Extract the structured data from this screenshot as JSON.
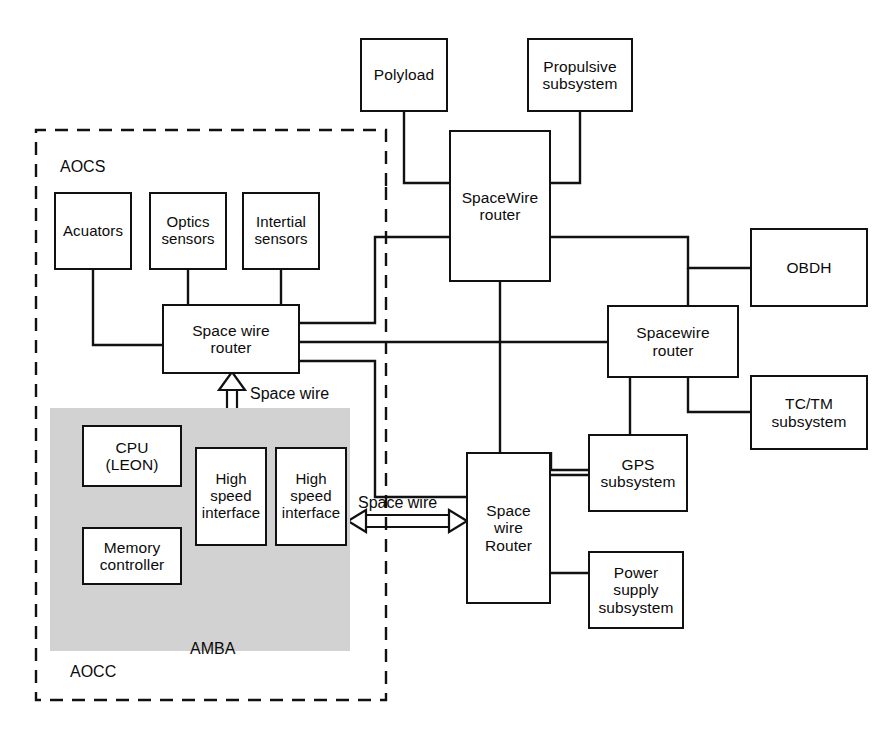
{
  "diagram": {
    "type": "block-diagram",
    "width": 896,
    "height": 732,
    "colors": {
      "background": "#ffffff",
      "line": "#111111",
      "shaded_region": "#d2d2d2",
      "text": "#0b0b0b"
    }
  },
  "regions": {
    "aocs": {
      "label": "AOCS",
      "style": "dashed-border",
      "description": "Attitude and Orbit Control System boundary"
    },
    "aocc": {
      "label": "AOCC",
      "style": "shaded-fill",
      "description": "Attitude and Orbit Control Computer shaded block"
    }
  },
  "nodes": {
    "polyload": {
      "label": "Polyload"
    },
    "propulsive_subsystem": {
      "line1": "Propulsive",
      "line2": "subsystem"
    },
    "spacewire_router_main": {
      "line1": "SpaceWire",
      "line2": "router"
    },
    "acuators": {
      "label": "Acuators"
    },
    "optics_sensors": {
      "line1": "Optics",
      "line2": "sensors"
    },
    "intertial_sensors": {
      "line1": "Intertial",
      "line2": "sensors"
    },
    "space_wire_router_aocs": {
      "line1": "Space wire",
      "line2": "router"
    },
    "spacewire_router_right": {
      "line1": "Spacewire",
      "line2": "router"
    },
    "obdh": {
      "label": "OBDH"
    },
    "tc_tm_subsystem": {
      "line1": "TC/TM",
      "line2": "subsystem"
    },
    "space_wire_router_platform": {
      "line1": "Space wire",
      "line2": "Router"
    },
    "gps_subsystem": {
      "line1": "GPS",
      "line2": "subsystem"
    },
    "power_supply_subsystem": {
      "line1": "Power",
      "line2": "supply",
      "line3": "subsystem"
    },
    "cpu_leon": {
      "line1": "CPU",
      "line2": "(LEON)"
    },
    "memory_controller": {
      "line1": "Memory",
      "line2": "controller"
    },
    "high_speed_interface_1": {
      "line1": "High",
      "line2": "speed",
      "line3": "interface"
    },
    "high_speed_interface_2": {
      "line1": "High",
      "line2": "speed",
      "line3": "interface"
    }
  },
  "edge_labels": {
    "space_wire_vertical": "Space wire",
    "space_wire_horizontal": "Space wire",
    "amba_bus": "AMBA"
  },
  "connections": [
    {
      "from": "polyload",
      "to": "spacewire_router_main",
      "style": "solid-line"
    },
    {
      "from": "propulsive_subsystem",
      "to": "spacewire_router_main",
      "style": "solid-line"
    },
    {
      "from": "space_wire_router_aocs",
      "to": "spacewire_router_main",
      "style": "solid-line"
    },
    {
      "from": "space_wire_router_aocs",
      "to": "spacewire_router_right",
      "style": "solid-line"
    },
    {
      "from": "space_wire_router_aocs",
      "to": "space_wire_router_platform",
      "style": "solid-line"
    },
    {
      "from": "spacewire_router_main",
      "to": "obdh",
      "style": "solid-line"
    },
    {
      "from": "spacewire_router_main",
      "to": "space_wire_router_platform",
      "style": "solid-line"
    },
    {
      "from": "spacewire_router_right",
      "to": "obdh",
      "style": "solid-line"
    },
    {
      "from": "spacewire_router_right",
      "to": "tc_tm_subsystem",
      "style": "solid-line"
    },
    {
      "from": "spacewire_router_right",
      "to": "space_wire_router_platform",
      "style": "solid-line"
    },
    {
      "from": "space_wire_router_platform",
      "to": "gps_subsystem",
      "style": "solid-line"
    },
    {
      "from": "space_wire_router_platform",
      "to": "power_supply_subsystem",
      "style": "solid-line"
    },
    {
      "from": "space_wire_router_aocs",
      "to": "high_speed_interface_1",
      "style": "double-hollow-arrow",
      "label": "Space wire"
    },
    {
      "from": "high_speed_interface_2",
      "to": "space_wire_router_platform",
      "style": "double-hollow-arrow",
      "label": "Space wire"
    },
    {
      "from": "cpu_leon",
      "to": "memory_controller",
      "style": "double-hollow-arrow"
    },
    {
      "from": "memory_controller",
      "to": "amba_bus",
      "style": "double-hollow-arrow"
    },
    {
      "from": "high_speed_interface_1",
      "to": "amba_bus",
      "style": "double-hollow-arrow"
    },
    {
      "from": "high_speed_interface_2",
      "to": "amba_bus",
      "style": "double-hollow-arrow"
    }
  ]
}
